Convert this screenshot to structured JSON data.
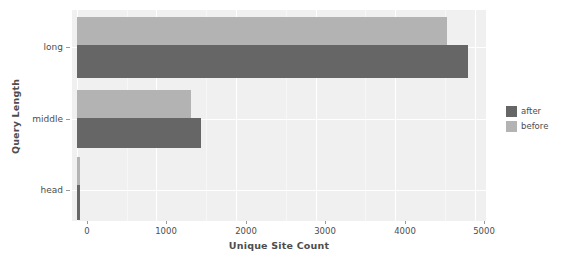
{
  "chart_data": {
    "type": "bar",
    "orientation": "horizontal",
    "title": "",
    "xlabel": "Unique Site Count",
    "ylabel": "Query Length",
    "categories": [
      "long",
      "middle",
      "head"
    ],
    "series": [
      {
        "name": "before",
        "color": "#b3b3b3",
        "values": [
          4650,
          1430,
          45
        ]
      },
      {
        "name": "after",
        "color": "#666666",
        "values": [
          4910,
          1555,
          45
        ]
      }
    ],
    "xticks": [
      0,
      1000,
      2000,
      3000,
      4000,
      5000
    ],
    "xticklabels": [
      "0",
      "1000",
      "2000",
      "3000",
      "4000",
      "5000"
    ],
    "xlim": [
      -60,
      5140
    ],
    "grid": true,
    "legend_position": "right",
    "legend_entries": [
      "after",
      "before"
    ],
    "panel_background": "#f0f0f0",
    "gridline_color": "#ffffff",
    "text_color": "#4d4d4d"
  }
}
